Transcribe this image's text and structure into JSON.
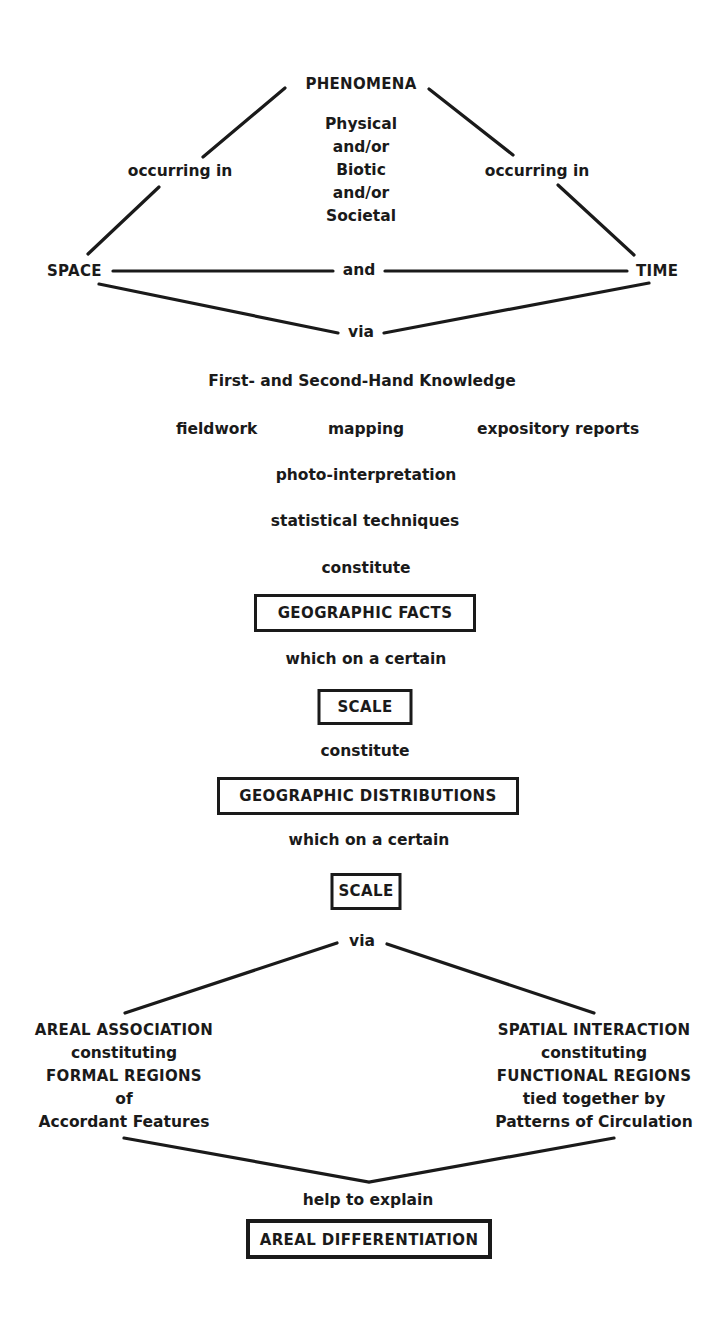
{
  "header_cutoff": "",
  "top": {
    "phenomena": "PHENOMENA",
    "phenomena_types": [
      "Physical",
      "and/or",
      "Biotic",
      "and/or",
      "Societal"
    ],
    "left_link": "occurring in",
    "right_link": "occurring in",
    "space": "SPACE",
    "and": "and",
    "time": "TIME",
    "via": "via"
  },
  "knowledge": {
    "title": "First- and Second-Hand Knowledge",
    "methods": [
      "fieldwork",
      "mapping",
      "expository reports",
      "photo-interpretation",
      "statistical techniques"
    ]
  },
  "flow": {
    "constitute_1": "constitute",
    "geographic_facts": "GEOGRAPHIC  FACTS",
    "which_on_certain_1": "which on a certain",
    "scale_1": "SCALE",
    "constitute_2": "constitute",
    "geographic_distributions": "GEOGRAPHIC  DISTRIBUTIONS",
    "which_on_certain_2": "which on a certain",
    "scale_2": "SCALE",
    "via": "via"
  },
  "branches": {
    "left": [
      "AREAL  ASSOCIATION",
      "constituting",
      "FORMAL  REGIONS",
      "of",
      "Accordant Features"
    ],
    "right": [
      "SPATIAL  INTERACTION",
      "constituting",
      "FUNCTIONAL  REGIONS",
      "tied together by",
      "Patterns of Circulation"
    ]
  },
  "bottom": {
    "help_to_explain": "help to explain",
    "areal_differentiation": "AREAL  DIFFERENTIATION"
  }
}
